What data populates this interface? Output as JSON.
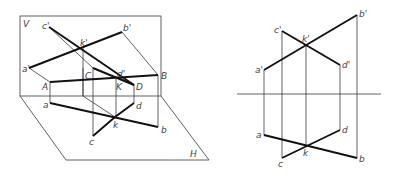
{
  "figure": {
    "left_view": {
      "plane_labels": {
        "vertical": "V",
        "horizontal": "H"
      },
      "space_points": {
        "A": "A",
        "B": "B",
        "C": "C",
        "D": "D",
        "K": "K"
      },
      "front_projections": {
        "a": "a'",
        "b": "b'",
        "c": "c'",
        "d": "d'",
        "k": "k'"
      },
      "top_projections": {
        "a": "a",
        "b": "b",
        "c": "c",
        "d": "d",
        "k": "k"
      }
    },
    "right_view": {
      "front_projections": {
        "a": "a'",
        "b": "b'",
        "c": "c'",
        "d": "d'",
        "k": "k'"
      },
      "top_projections": {
        "a": "a",
        "b": "b",
        "c": "c",
        "d": "d",
        "k": "k"
      }
    }
  }
}
